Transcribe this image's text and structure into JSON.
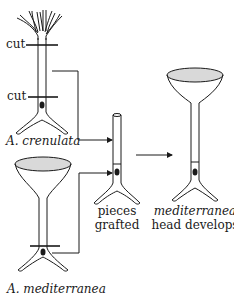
{
  "diagram": {
    "labels": {
      "cut_top": "cut",
      "cut_bottom": "cut",
      "species_crenulata": "A. crenulata",
      "species_mediterranea": "A. mediterranea",
      "grafted_line1": "pieces",
      "grafted_line2": "grafted",
      "result_line1": "mediterranea",
      "result_line2": "head develops"
    },
    "nodes": [
      {
        "id": "crenulata",
        "label": "A. crenulata",
        "cap": "branched fronds",
        "cuts": 2
      },
      {
        "id": "mediterranea",
        "label": "A. mediterranea",
        "cap": "umbrella cap",
        "cuts": 1
      },
      {
        "id": "grafted",
        "label": "pieces grafted",
        "cap": "none"
      },
      {
        "id": "result",
        "label": "mediterranea head develops",
        "cap": "umbrella cap"
      }
    ],
    "edges": [
      {
        "from": "crenulata",
        "to": "grafted",
        "note": "stalk segment between cuts"
      },
      {
        "from": "mediterranea",
        "to": "grafted",
        "note": "base with nucleus"
      },
      {
        "from": "grafted",
        "to": "result"
      }
    ],
    "colors": {
      "line": "#1a1a1a",
      "cap_fill": "#d9d9d9",
      "background": "#ffffff"
    }
  }
}
